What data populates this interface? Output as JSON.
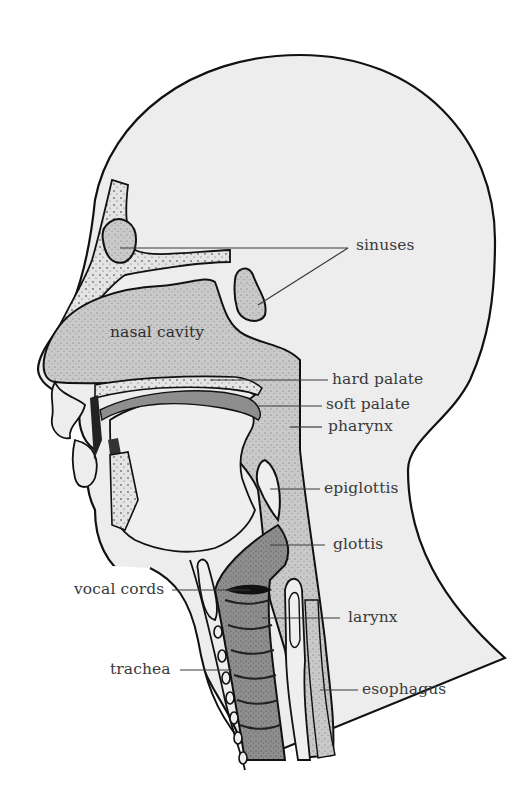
{
  "diagram": {
    "colors": {
      "background": "#ffffff",
      "head_fill": "#ededed",
      "cavity_fill": "#c9c9c9",
      "larynx_fill": "#8e8e8e",
      "outline": "#111111",
      "leader_line": "#3a3a3a",
      "label_text": "#3a3a3a"
    },
    "labels": {
      "sinuses": "sinuses",
      "nasal_cavity": "nasal cavity",
      "hard_palate": "hard palate",
      "soft_palate": "soft palate",
      "pharynx": "pharynx",
      "epiglottis": "epiglottis",
      "glottis": "glottis",
      "vocal_cords": "vocal cords",
      "larynx": "larynx",
      "trachea": "trachea",
      "esophagus": "esophagus"
    }
  }
}
